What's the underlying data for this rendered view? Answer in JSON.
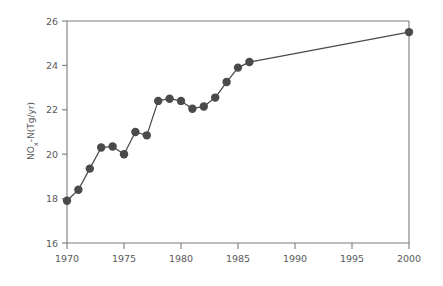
{
  "chart_data": {
    "type": "line",
    "title": "",
    "subtitle": "",
    "xlabel": "",
    "ylabel": "NOx-N(Tg/yr)",
    "ylabel_parts": {
      "base": "NO",
      "subscript": "x",
      "suffix": "-N(Tg/yr)"
    },
    "xlim": [
      1970,
      2000
    ],
    "ylim": [
      16,
      26
    ],
    "xticks": [
      1970,
      1975,
      1980,
      1985,
      1990,
      1995,
      2000
    ],
    "xticklabels": [
      "1970",
      "1975",
      "1980",
      "1985",
      "1990",
      "1995",
      "2000"
    ],
    "yticks": [
      16,
      18,
      20,
      22,
      24,
      26
    ],
    "yticklabels": [
      "16",
      "18",
      "20",
      "22",
      "24",
      "26"
    ],
    "grid": false,
    "legend": null,
    "legend_position": "none",
    "marker": "filled-circle",
    "marker_size": 4.2,
    "line_color": "#4a4a4c",
    "marker_color": "#4a4a4c",
    "axis_color": "#7b7c7e",
    "background_color": "#ffffff",
    "text_color": "#58595b",
    "series": [
      {
        "name": "NOx-N emissions",
        "x": [
          1970,
          1971,
          1972,
          1973,
          1974,
          1975,
          1976,
          1977,
          1978,
          1979,
          1980,
          1981,
          1982,
          1983,
          1984,
          1985,
          1986,
          2000
        ],
        "values": [
          17.9,
          18.4,
          19.35,
          20.3,
          20.35,
          20.0,
          21.0,
          20.85,
          22.4,
          22.5,
          22.4,
          22.05,
          22.15,
          22.55,
          23.25,
          23.9,
          24.15,
          25.5
        ]
      }
    ],
    "annotations": []
  }
}
